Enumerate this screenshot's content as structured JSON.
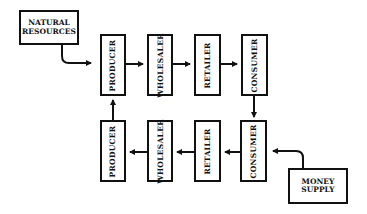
{
  "diagram": {
    "type": "flow",
    "sources": {
      "natural_resources": "NATURAL\nRESOURCES",
      "money_supply": "MONEY\nSUPPLY"
    },
    "top_row": [
      {
        "label": "PRODUCER"
      },
      {
        "label": "WHOLESALER"
      },
      {
        "label": "RETAILER"
      },
      {
        "label": "CONSUMER"
      }
    ],
    "bottom_row": [
      {
        "label": "PRODUCER"
      },
      {
        "label": "WHOLESALER"
      },
      {
        "label": "RETAILER"
      },
      {
        "label": "CONSUMER"
      }
    ],
    "edges": [
      {
        "from": "NATURAL RESOURCES",
        "to": "PRODUCER (top)"
      },
      {
        "from": "PRODUCER (top)",
        "to": "WHOLESALER (top)"
      },
      {
        "from": "WHOLESALER (top)",
        "to": "RETAILER (top)"
      },
      {
        "from": "RETAILER (top)",
        "to": "CONSUMER (top)"
      },
      {
        "from": "CONSUMER (top)",
        "to": "CONSUMER (bottom)"
      },
      {
        "from": "MONEY SUPPLY",
        "to": "CONSUMER (bottom)"
      },
      {
        "from": "CONSUMER (bottom)",
        "to": "RETAILER (bottom)"
      },
      {
        "from": "RETAILER (bottom)",
        "to": "WHOLESALER (bottom)"
      },
      {
        "from": "WHOLESALER (bottom)",
        "to": "PRODUCER (bottom)"
      },
      {
        "from": "PRODUCER (bottom)",
        "to": "PRODUCER (top)"
      }
    ],
    "colors": {
      "line": "#111111",
      "background": "#ffffff"
    }
  }
}
